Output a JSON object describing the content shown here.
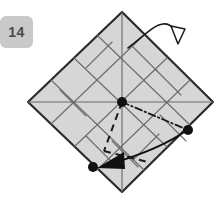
{
  "diagram": {
    "kind": "origami-instruction-step",
    "step_number": "14",
    "title": "14",
    "canvas": {
      "width": 224,
      "height": 203
    },
    "colors": {
      "paper_fill": "#d6d6d6",
      "paper_edge": "#2b2b2b",
      "crease_line": "#6b6b6b",
      "fold_line_dark": "#1a1a1a",
      "arrow": "#111111",
      "badge_bg": "#c9c9c9",
      "badge_text": "#4a4a4a",
      "background": "#ffffff"
    },
    "paper": {
      "shape": "square-rotated-45",
      "corners": {
        "top": {
          "x": 122,
          "y": 12
        },
        "right": {
          "x": 213,
          "y": 102
        },
        "bottom": {
          "x": 122,
          "y": 192
        },
        "left": {
          "x": 28,
          "y": 102
        }
      },
      "edge_width": 2.2
    },
    "crease_lines": [
      {
        "name": "grid-a1",
        "x1": 74,
        "y1": 58,
        "x2": 167,
        "y2": 147
      },
      {
        "name": "grid-a2",
        "x1": 51,
        "y1": 80,
        "x2": 144,
        "y2": 170
      },
      {
        "name": "grid-a3",
        "x1": 97,
        "y1": 35,
        "x2": 190,
        "y2": 125
      },
      {
        "name": "grid-b1",
        "x1": 74,
        "y1": 147,
        "x2": 167,
        "y2": 58
      },
      {
        "name": "grid-b2",
        "x1": 51,
        "y1": 124,
        "x2": 144,
        "y2": 35
      },
      {
        "name": "grid-b3",
        "x1": 97,
        "y1": 170,
        "x2": 190,
        "y2": 80
      },
      {
        "name": "axis-vertical",
        "x1": 122,
        "y1": 12,
        "x2": 122,
        "y2": 192
      },
      {
        "name": "axis-horizontal",
        "x1": 28,
        "y1": 102,
        "x2": 213,
        "y2": 102
      },
      {
        "name": "diag-short-1",
        "x1": 60,
        "y1": 90,
        "x2": 86,
        "y2": 116
      },
      {
        "name": "diag-short-2",
        "x1": 86,
        "y1": 68,
        "x2": 112,
        "y2": 42
      },
      {
        "name": "diag-short-3",
        "x1": 155,
        "y1": 69,
        "x2": 181,
        "y2": 95
      },
      {
        "name": "diag-short-4",
        "x1": 131,
        "y1": 45,
        "x2": 157,
        "y2": 71
      },
      {
        "name": "diag-short-5",
        "x1": 86,
        "y1": 136,
        "x2": 112,
        "y2": 162
      },
      {
        "name": "diag-short-6",
        "x1": 133,
        "y1": 160,
        "x2": 159,
        "y2": 134
      },
      {
        "name": "diag-short-7",
        "x1": 112,
        "y1": 141,
        "x2": 138,
        "y2": 167
      },
      {
        "name": "diag-short-8",
        "x1": 160,
        "y1": 115,
        "x2": 186,
        "y2": 141
      }
    ],
    "fold_lines": [
      {
        "name": "mountain-dash-dot",
        "style": "dash-dot",
        "x1": 122,
        "y1": 102,
        "x2": 188,
        "y2": 130
      },
      {
        "name": "valley-dashed-left",
        "style": "dashed",
        "x1": 122,
        "y1": 102,
        "x2": 104,
        "y2": 150
      },
      {
        "name": "valley-dashed-right",
        "style": "dashed",
        "x1": 104,
        "y1": 150,
        "x2": 147,
        "y2": 161
      }
    ],
    "reference_points": [
      {
        "name": "center-point",
        "x": 122,
        "y": 102,
        "r": 5
      },
      {
        "name": "right-edge-point",
        "x": 188,
        "y": 130,
        "r": 5
      },
      {
        "name": "bottom-left-point",
        "x": 93,
        "y": 167,
        "r": 5
      }
    ],
    "arrows": [
      {
        "name": "unfold-arrow",
        "type": "fold-and-unfold",
        "head": "hollow",
        "path": "M 130 47 C 144 38, 152 27, 162 25 C 172 23, 176 29, 178 39",
        "head_points": "172,28 186,31 178,43"
      },
      {
        "name": "fold-arrow",
        "type": "valley-fold",
        "head": "solid",
        "path": "M 187 130 C 172 140, 146 152, 108 164",
        "head_points": "98,167 122,155 124,168"
      }
    ]
  }
}
